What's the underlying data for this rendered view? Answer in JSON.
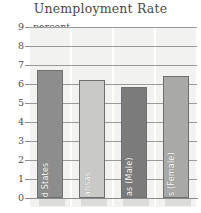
{
  "chart_data": {
    "type": "bar",
    "title": "Unemployment Rate",
    "xlabel": "",
    "ylabel": "percent",
    "ylim": [
      0,
      9
    ],
    "ytick_step": 1,
    "yticks": [
      "9",
      "8",
      "7",
      "6",
      "5",
      "4",
      "3",
      "2",
      "1",
      "0"
    ],
    "grid": true,
    "legend": "none",
    "categories": [
      "United States",
      "Arkansas",
      "Arkansas (Male)",
      "Arkansas (Female)"
    ],
    "values": [
      6.75,
      6.2,
      5.85,
      6.4
    ],
    "bar_colors": [
      "#8d8d8d",
      "#c9c9c7",
      "#7b7b7b",
      "#a9a9a7"
    ],
    "bar_border_color": "#6f6f6f",
    "series": [
      {
        "name": "Unemployment Rate",
        "values": [
          6.75,
          6.2,
          5.85,
          6.4
        ]
      }
    ]
  },
  "chart": {
    "title": "Unemployment Rate",
    "unit_caption": "percent",
    "axis": {
      "ticks": [
        {
          "label": "9",
          "value": 9
        },
        {
          "label": "8",
          "value": 8
        },
        {
          "label": "7",
          "value": 7
        },
        {
          "label": "6",
          "value": 6
        },
        {
          "label": "5",
          "value": 5
        },
        {
          "label": "4",
          "value": 4
        },
        {
          "label": "3",
          "value": 3
        },
        {
          "label": "2",
          "value": 2
        },
        {
          "label": "1",
          "value": 1
        },
        {
          "label": "0",
          "value": 0
        }
      ]
    },
    "bars": [
      {
        "label": "United States",
        "value": 6.75,
        "color": "#8d8d8d"
      },
      {
        "label": "Arkansas",
        "value": 6.2,
        "color": "#c9c9c7"
      },
      {
        "label": "Arkansas (Male)",
        "value": 5.85,
        "color": "#7b7b7b"
      },
      {
        "label": "Arkansas (Female)",
        "value": 6.4,
        "color": "#a9a9a7"
      }
    ]
  },
  "colors": {
    "grid": "#9a9a9a",
    "axis_text": "#4e4e4e",
    "title_text": "#4a4a4a",
    "background": "#ffffff",
    "band": "#f2f2f0",
    "shadow": "#dcdcda"
  }
}
